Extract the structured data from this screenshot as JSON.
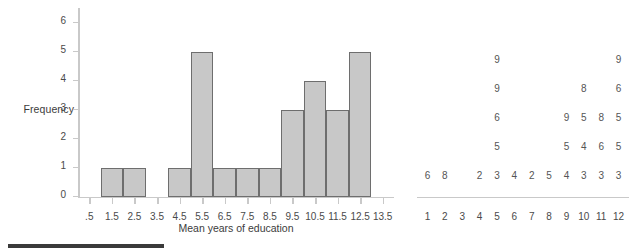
{
  "chart_data": [
    {
      "type": "bar",
      "title": "",
      "xlabel": "Mean years of education",
      "ylabel": "Frequency",
      "xtick_labels": [
        ".5",
        "1.5",
        "2.5",
        "3.5",
        "4.5",
        "5.5",
        "6.5",
        "7.5",
        "8.5",
        "9.5",
        "10.5",
        "11.5",
        "12.5",
        "13.5"
      ],
      "xtick_values": [
        0.5,
        1.5,
        2.5,
        3.5,
        4.5,
        5.5,
        6.5,
        7.5,
        8.5,
        9.5,
        10.5,
        11.5,
        12.5,
        13.5
      ],
      "ytick_labels": [
        "0",
        "1",
        "2",
        "3",
        "4",
        "5",
        "6"
      ],
      "ytick_values": [
        0,
        1,
        2,
        3,
        4,
        5,
        6
      ],
      "xlim": [
        0.0,
        14.0
      ],
      "ylim": [
        0,
        6
      ],
      "grid": false,
      "bar_color": "#c8c8c8",
      "bar_edge_color": "#6e6e6e",
      "bin_width": 1,
      "categories": [
        "1.5",
        "2.5",
        "3.5",
        "4.5",
        "5.5",
        "6.5",
        "7.5",
        "8.5",
        "9.5",
        "10.5",
        "11.5",
        "12.5"
      ],
      "values": [
        1,
        1,
        0,
        1,
        5,
        1,
        1,
        1,
        3,
        4,
        3,
        5
      ]
    },
    {
      "type": "bar",
      "subtype": "stacked-digit-dotplot",
      "title": "",
      "xlabel": "",
      "ylabel": "",
      "xtick_labels": [
        "1",
        "2",
        "3",
        "4",
        "5",
        "6",
        "7",
        "8",
        "9",
        "10",
        "11",
        "12"
      ],
      "xtick_values": [
        1,
        2,
        3,
        4,
        5,
        6,
        7,
        8,
        9,
        10,
        11,
        12
      ],
      "xlim": [
        0.4,
        12.6
      ],
      "ylim": [
        0,
        6
      ],
      "grid": false,
      "digit_color": "#555555",
      "categories": [
        "1",
        "2",
        "3",
        "4",
        "5",
        "6",
        "7",
        "8",
        "9",
        "10",
        "11",
        "12"
      ],
      "values": [
        1,
        1,
        0,
        1,
        5,
        1,
        1,
        1,
        3,
        4,
        3,
        5
      ],
      "columns": [
        {
          "tick": "1",
          "digits": [
            "6"
          ]
        },
        {
          "tick": "2",
          "digits": [
            "8"
          ]
        },
        {
          "tick": "3",
          "digits": []
        },
        {
          "tick": "4",
          "digits": [
            "2"
          ]
        },
        {
          "tick": "5",
          "digits": [
            "3",
            "5",
            "6",
            "9",
            "9"
          ]
        },
        {
          "tick": "6",
          "digits": [
            "4"
          ]
        },
        {
          "tick": "7",
          "digits": [
            "2"
          ]
        },
        {
          "tick": "8",
          "digits": [
            "5"
          ]
        },
        {
          "tick": "9",
          "digits": [
            "4",
            "5",
            "9"
          ]
        },
        {
          "tick": "10",
          "digits": [
            "3",
            "4",
            "5",
            "8"
          ]
        },
        {
          "tick": "11",
          "digits": [
            "3",
            "6",
            "8"
          ]
        },
        {
          "tick": "12",
          "digits": [
            "3",
            "5",
            "5",
            "6",
            "9"
          ]
        }
      ]
    }
  ]
}
